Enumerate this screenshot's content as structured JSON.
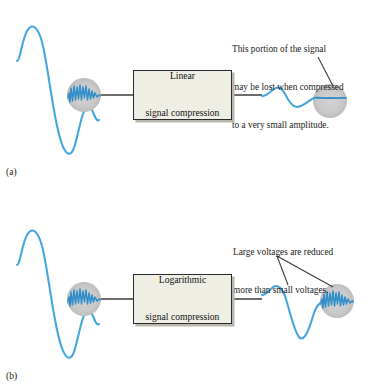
{
  "figure": {
    "title_fragment": "",
    "background_color": "#ffffff",
    "wave_color": "#46a6df",
    "wave_color_dark": "#2f8ec9",
    "bubble_color": "#c9c9c9",
    "leader_color": "#3c3c3c",
    "box_fill": "#efeee4",
    "box_border": "#2b2b2b",
    "box_shadow": "#b9b7ac"
  },
  "panels": [
    {
      "id": "a",
      "label": "(a)",
      "box_label_line1": "Linear",
      "box_label_line2": "signal compression",
      "annotation_lines": [
        "This portion of the signal",
        "may be lost when compressed",
        "to a very small amplitude."
      ],
      "input_detail_state": "ripple-visible",
      "output_detail_state": "ripple-lost"
    },
    {
      "id": "b",
      "label": "(b)",
      "box_label_line1": "Logarithmic",
      "box_label_line2": "signal compression",
      "annotation_lines": [
        "Large voltages are reduced",
        "more than small voltages."
      ],
      "input_detail_state": "ripple-visible",
      "output_detail_state": "ripple-preserved"
    }
  ]
}
